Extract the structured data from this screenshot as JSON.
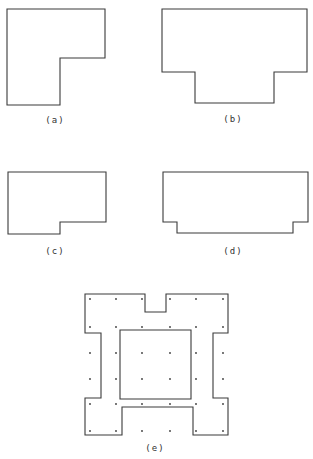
{
  "figure": {
    "panels": [
      {
        "id": "a",
        "label": "(a)",
        "label_pos": [
          55,
          123
        ],
        "points": "7,9 105,9 105,58 60,58 60,105 7,105"
      },
      {
        "id": "b",
        "label": "(b)",
        "label_pos": [
          233,
          122
        ],
        "points": "162,9 307,9 307,72 274,72 274,103 195,103 195,72 162,72"
      },
      {
        "id": "c",
        "label": "(c)",
        "label_pos": [
          55,
          254
        ],
        "points": "8,172 106,172 106,222 60,222 60,234 8,234"
      },
      {
        "id": "d",
        "label": "(d)",
        "label_pos": [
          233,
          254
        ],
        "points": "163,172 308,172 308,222 293,222 293,233 177,233 177,222 163,222"
      },
      {
        "id": "e",
        "label": "(e)",
        "label_pos": [
          155,
          451
        ],
        "outer_points": "85,294 145,294 145,312 166,312 166,294 228,294 228,333 213,333 213,398 228,398 228,435 193,435 193,407 122,407 122,435 85,435 85,398 101,398 101,333 85,333",
        "inner_points": "120,330 191,330 191,399 120,399",
        "dot_columns": [
          90,
          116,
          142,
          170,
          196,
          223
        ],
        "dot_rows": [
          299,
          327,
          353,
          379,
          404,
          431
        ]
      }
    ],
    "stroke_color": "#3a3a3a",
    "background": "#ffffff"
  }
}
